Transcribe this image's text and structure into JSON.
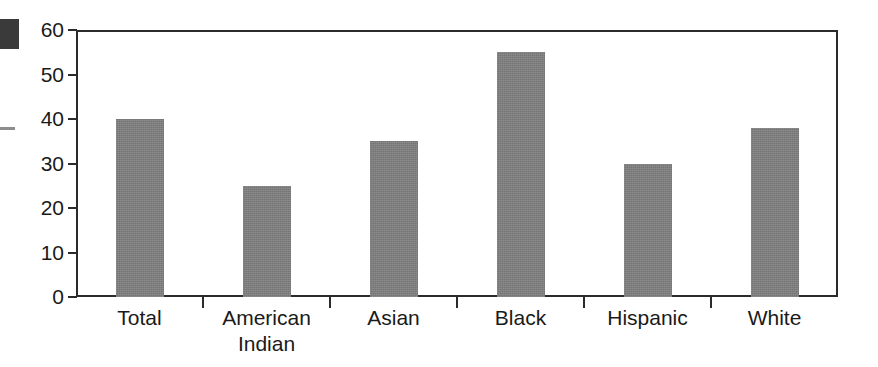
{
  "chart_data": {
    "type": "bar",
    "title": "",
    "subtitle": "",
    "xlabel": "",
    "ylabel": "",
    "categories": [
      "Total",
      "American\nIndian",
      "Asian",
      "Black",
      "Hispanic",
      "White"
    ],
    "values": [
      40,
      25,
      35,
      55,
      30,
      38
    ],
    "ylim": [
      0,
      60
    ],
    "y_ticks": [
      0,
      10,
      20,
      30,
      40,
      50,
      60
    ],
    "y_tick_labels": [
      "0",
      "10",
      "20",
      "30",
      "40",
      "50",
      "60"
    ],
    "grid": true,
    "legend": null,
    "legend_position": "none",
    "series": [
      {
        "name": "",
        "values": [
          40,
          25,
          35,
          55,
          30,
          38
        ]
      }
    ],
    "colors": {
      "bar_fill": "#808080",
      "axis_line": "#2b2b2b",
      "gridline": "#c2c2c2",
      "text": "#1a1a1a",
      "background": "#ffffff"
    }
  },
  "artifacts": {
    "corner_block_color": "#3a3a3a",
    "edge_dash_color": "#8d8d8d"
  }
}
